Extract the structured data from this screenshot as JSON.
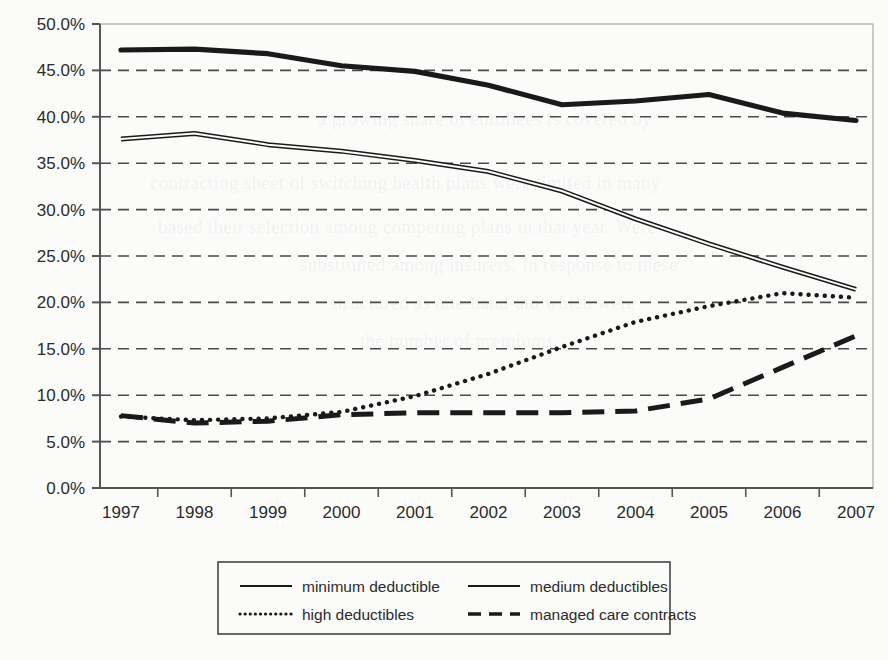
{
  "chart_data": {
    "type": "line",
    "title": "",
    "xlabel": "",
    "ylabel": "",
    "x": [
      1997,
      1998,
      1999,
      2000,
      2001,
      2002,
      2003,
      2004,
      2005,
      2006,
      2007
    ],
    "categories": [
      "1997",
      "1998",
      "1999",
      "2000",
      "2001",
      "2002",
      "2003",
      "2004",
      "2005",
      "2006",
      "2007"
    ],
    "ylim": [
      0,
      50
    ],
    "ytick_labels": [
      "0.0%",
      "5.0%",
      "10.0%",
      "15.0%",
      "20.0%",
      "25.0%",
      "30.0%",
      "35.0%",
      "40.0%",
      "45.0%",
      "50.0%"
    ],
    "ytick_values": [
      0,
      5,
      10,
      15,
      20,
      25,
      30,
      35,
      40,
      45,
      50
    ],
    "grid": "horizontal-dashed",
    "legend_position": "bottom",
    "series": [
      {
        "name": "minimum deductible",
        "style": "solid-thick",
        "values": [
          47.2,
          47.3,
          46.8,
          45.5,
          44.9,
          43.4,
          41.3,
          41.7,
          42.4,
          40.4,
          39.6
        ]
      },
      {
        "name": "medium deductibles",
        "style": "solid-thin",
        "values": [
          37.6,
          38.2,
          37.0,
          36.3,
          35.3,
          34.1,
          32.0,
          29.0,
          26.3,
          23.8,
          21.4
        ]
      },
      {
        "name": "high deductibles",
        "style": "dotted",
        "values": [
          7.7,
          7.3,
          7.5,
          8.2,
          9.9,
          12.3,
          15.2,
          17.9,
          19.6,
          21.0,
          20.5
        ]
      },
      {
        "name": "managed care contracts",
        "style": "dashed",
        "values": [
          7.8,
          7.0,
          7.2,
          7.9,
          8.1,
          8.1,
          8.1,
          8.3,
          9.6,
          13.0,
          16.4
        ]
      }
    ]
  },
  "legend": {
    "items": [
      {
        "label": "minimum deductible",
        "style": "solid-thick"
      },
      {
        "label": "medium deductibles",
        "style": "solid-thin"
      },
      {
        "label": "high deductibles",
        "style": "dotted"
      },
      {
        "label": "managed care contracts",
        "style": "dashed"
      }
    ]
  },
  "colors": {
    "ink": "#1a1a1a",
    "grid": "#4a4a4a",
    "axis": "#555555",
    "page": "#fbfbfa"
  },
  "background_text": {
    "lines": [
      "a growing share of enrollees is covered by",
      "contracting sheet of switching health plans were limited in many",
      "based their selection among competing plans in that year. Were",
      "substituted among insurers. In response to these",
      "structured as one-hand-aid which were",
      "the number of premiums"
    ]
  }
}
